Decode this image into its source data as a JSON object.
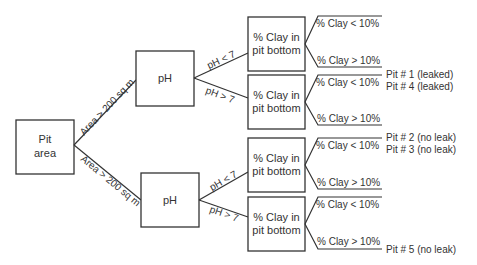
{
  "diagram": {
    "type": "decision-tree",
    "root": {
      "label_line1": "Pit",
      "label_line2": "area"
    },
    "area_edges": [
      {
        "label": "Area > 200 sq m"
      },
      {
        "label": "Area > 200 sq m"
      }
    ],
    "ph_nodes": [
      {
        "label": "pH"
      },
      {
        "label": "pH"
      }
    ],
    "ph_edges": [
      {
        "label": "pH < 7"
      },
      {
        "label": "pH > 7"
      },
      {
        "label": "pH < 7"
      },
      {
        "label": "pH > 7"
      }
    ],
    "clay_nodes": [
      {
        "label_line1": "% Clay in",
        "label_line2": "pit bottom"
      },
      {
        "label_line1": "% Clay in",
        "label_line2": "pit bottom"
      },
      {
        "label_line1": "% Clay in",
        "label_line2": "pit bottom"
      },
      {
        "label_line1": "% Clay in",
        "label_line2": "pit bottom"
      }
    ],
    "leaves": [
      {
        "low": "% Clay < 10%",
        "high": "% Clay > 10%"
      },
      {
        "low": "% Clay < 10%",
        "high": "% Clay > 10%"
      },
      {
        "low": "% Clay < 10%",
        "high": "% Clay > 10%"
      },
      {
        "low": "% Clay < 10%",
        "high": "% Clay > 10%"
      }
    ],
    "outcomes": {
      "pit1": "Pit # 1 (leaked)",
      "pit4": "Pit # 4 (leaked)",
      "pit2": "Pit # 2 (no leak)",
      "pit3": "Pit # 3 (no leak)",
      "pit5": "Pit # 5 (no leak)"
    },
    "colors": {
      "line": "#333333",
      "background": "#ffffff"
    }
  }
}
